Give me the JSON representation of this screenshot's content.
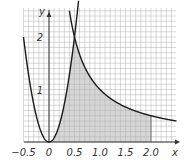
{
  "chart_data": {
    "type": "area",
    "title": "",
    "xlabel": "x",
    "ylabel": "y",
    "xlim": [
      -0.5,
      2.5
    ],
    "ylim": [
      0,
      2.55
    ],
    "grid": true,
    "grid_minor_step": 0.1,
    "x_ticks": [
      {
        "value": -0.5,
        "label": "-0.5"
      },
      {
        "value": 0,
        "label": "0"
      },
      {
        "value": 0.5,
        "label": "0.5"
      },
      {
        "value": 1.0,
        "label": "1.0"
      },
      {
        "value": 1.5,
        "label": "1.5"
      },
      {
        "value": 2.0,
        "label": "2.0"
      }
    ],
    "y_ticks": [
      {
        "value": 1,
        "label": "1"
      },
      {
        "value": 2,
        "label": "2"
      }
    ],
    "series": [
      {
        "name": "parabola",
        "formula": "y = 8x^2",
        "x": [
          -0.5,
          -0.25,
          0,
          0.25,
          0.5
        ],
        "y": [
          2,
          0.5,
          0,
          0.5,
          2
        ]
      },
      {
        "name": "hyperbola",
        "formula": "y = 1/x",
        "x": [
          0.5,
          1.0,
          1.5,
          2.0,
          2.5
        ],
        "y": [
          2,
          1,
          0.667,
          0.5,
          0.4
        ]
      }
    ],
    "shaded_region": {
      "description": "area under y=8x^2 on [0,0.5] and under y=1/x on [0.5,2]",
      "x_from": 0,
      "x_to": 2.0
    },
    "colors": {
      "curve": "#1a1a1a",
      "grid": "#b0b0b0",
      "shade": "#c8c8c8"
    }
  },
  "labels": {
    "x_axis": "x",
    "y_axis": "y"
  }
}
